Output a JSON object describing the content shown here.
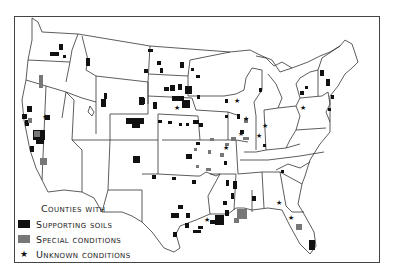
{
  "legend": {
    "title": "Counties with",
    "items": [
      {
        "label": "Supporting soils",
        "type": "swatch",
        "color": "#111111"
      },
      {
        "label": "Special conditions",
        "type": "swatch",
        "color": "#777777"
      },
      {
        "label": "Unknown conditions",
        "type": "star",
        "symbol": "★",
        "color": "#111111"
      }
    ]
  },
  "colors": {
    "supporting": "#111111",
    "special": "#777777",
    "border": "#444444",
    "background": "#ffffff"
  }
}
